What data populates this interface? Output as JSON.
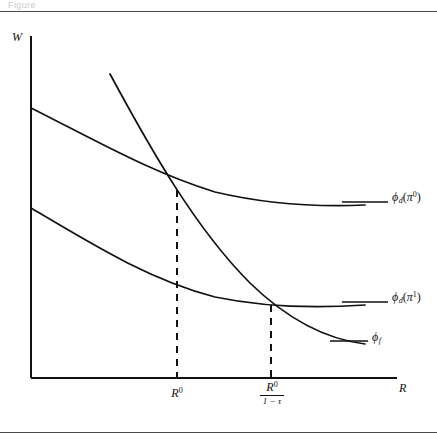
{
  "figure": {
    "caption_fragment": "Figure",
    "axes": {
      "y_label": "W",
      "x_label": "R"
    },
    "x_ticks": [
      {
        "name": "R0",
        "base": "R",
        "sup": "0"
      },
      {
        "name": "R0-over-1-minus-tau",
        "num_base": "R",
        "num_sup": "0",
        "den": "1 − τ"
      }
    ],
    "curves": [
      {
        "name": "phi-d-pi0",
        "label_phi": "ϕ",
        "label_sub": "d",
        "label_arg_open": "(",
        "label_arg_base": "π",
        "label_arg_sup": "0",
        "label_arg_close": ")",
        "path": "M 31,108 C 95,140 150,172 215,192 C 270,205 320,207 365,205",
        "leader": "M 342,202 L 388,202"
      },
      {
        "name": "phi-d-pi1",
        "label_phi": "ϕ",
        "label_sub": "d",
        "label_arg_open": "(",
        "label_arg_base": "π",
        "label_arg_sup": "1",
        "label_arg_close": ")",
        "path": "M 31,208 C 95,246 150,280 215,297 C 268,308 322,308 365,305",
        "leader": "M 342,302 L 388,302"
      },
      {
        "name": "phi-f",
        "label_phi": "ϕ",
        "label_sub": "f",
        "path": "M 110,74 C 150,148 195,228 250,283 C 288,320 325,339 365,344",
        "leader": "M 330,341 L 368,341"
      }
    ],
    "droplines": [
      {
        "name": "dropline-R0",
        "x": 177,
        "y_top": 190,
        "y_bottom": 378
      },
      {
        "name": "dropline-R0-over-1-minus-tau",
        "x": 271,
        "y_top": 305,
        "y_bottom": 378
      }
    ],
    "intersections": [
      {
        "name": "intersection-R0",
        "x": 177,
        "y": 189
      },
      {
        "name": "intersection-R0-over-1-minus-tau",
        "x": 271,
        "y": 303
      }
    ],
    "axis_geometry": {
      "origin_x": 31,
      "origin_y": 378,
      "y_top": 36,
      "x_right": 397
    },
    "colors": {
      "ink": "#111111",
      "rule": "#4a4a4a",
      "background": "#ffffff"
    }
  }
}
